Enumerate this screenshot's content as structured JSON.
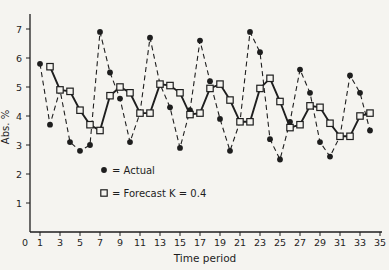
{
  "figure": {
    "background": "#f5f4f0",
    "ink": "#1e1e1e"
  },
  "chart_data": {
    "type": "line",
    "title": "",
    "xlabel": "Time period",
    "ylabel": "Abs. %",
    "xlim": [
      0,
      35
    ],
    "ylim": [
      0,
      7.5
    ],
    "grid": false,
    "x_ticks": [
      0,
      1,
      3,
      5,
      7,
      9,
      11,
      13,
      15,
      17,
      19,
      21,
      23,
      25,
      27,
      29,
      31,
      33,
      35
    ],
    "y_ticks": [
      1,
      2,
      3,
      4,
      5,
      6,
      7
    ],
    "legend": {
      "position": "inside-lower-left",
      "entries": [
        {
          "marker": "filled-circle",
          "label": "= Actual"
        },
        {
          "marker": "open-square",
          "label": "= Forecast  K = 0.4"
        }
      ]
    },
    "series": [
      {
        "name": "Actual",
        "marker": "filled-circle",
        "line_style": "dashed",
        "x": [
          1,
          2,
          3,
          4,
          5,
          6,
          7,
          8,
          9,
          10,
          11,
          12,
          13,
          14,
          15,
          16,
          17,
          18,
          19,
          20,
          21,
          22,
          23,
          24,
          25,
          26,
          27,
          28,
          29,
          30,
          31,
          32,
          33,
          34
        ],
        "values": [
          5.8,
          3.7,
          4.9,
          3.1,
          2.8,
          3.0,
          6.9,
          5.5,
          4.6,
          3.1,
          4.1,
          6.7,
          5.1,
          4.3,
          2.9,
          4.2,
          6.6,
          5.2,
          3.9,
          2.8,
          3.8,
          6.9,
          6.2,
          3.2,
          2.5,
          3.8,
          5.6,
          4.8,
          3.1,
          2.6,
          3.3,
          5.4,
          4.8,
          3.5
        ]
      },
      {
        "name": "Forecast K = 0.4",
        "marker": "open-square",
        "line_style": "solid",
        "x": [
          2,
          3,
          4,
          5,
          6,
          7,
          8,
          9,
          10,
          11,
          12,
          13,
          14,
          15,
          16,
          17,
          18,
          19,
          20,
          21,
          22,
          23,
          24,
          25,
          26,
          27,
          28,
          29,
          30,
          31,
          32,
          33,
          34
        ],
        "values": [
          5.7,
          4.9,
          4.85,
          4.2,
          3.7,
          3.5,
          4.7,
          5.0,
          4.8,
          4.1,
          4.1,
          5.1,
          5.05,
          4.8,
          4.05,
          4.1,
          4.95,
          5.1,
          4.55,
          3.8,
          3.8,
          4.95,
          5.3,
          4.5,
          3.6,
          3.7,
          4.35,
          4.3,
          3.75,
          3.3,
          3.3,
          4.0,
          4.1
        ]
      }
    ]
  }
}
